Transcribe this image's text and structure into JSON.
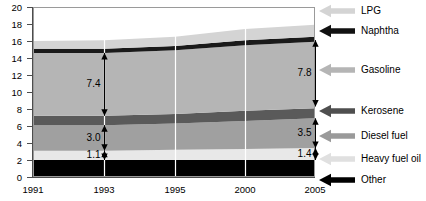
{
  "chart_data": {
    "type": "area",
    "stacked": true,
    "title": "",
    "subtitle": "",
    "xlabel": "",
    "ylabel": "",
    "x": [
      1991,
      1993,
      1995,
      2000,
      2005
    ],
    "xtick_labels": [
      "1991",
      "1993",
      "1995",
      "2000",
      "2005"
    ],
    "xtick_positions_px": [
      33,
      104,
      175,
      245,
      315
    ],
    "ylim": [
      0,
      20
    ],
    "ytick_labels": [
      "0",
      "2",
      "4",
      "6",
      "8",
      "10",
      "12",
      "14",
      "16",
      "18",
      "20"
    ],
    "ytick_values": [
      0,
      2,
      4,
      6,
      8,
      10,
      12,
      14,
      16,
      18,
      20
    ],
    "grid": "vertical-only",
    "gridline_color": "#ffffff",
    "gridline_x": [
      1993,
      1995,
      2000
    ],
    "legend_position": "right",
    "series": [
      {
        "name": "Other",
        "color": "#000000",
        "values": [
          2.0,
          2.0,
          2.0,
          2.0,
          2.0
        ]
      },
      {
        "name": "Heavy fuel oil",
        "color": "#e8e8e8",
        "values": [
          1.1,
          1.1,
          1.2,
          1.3,
          1.4
        ]
      },
      {
        "name": "Diesel fuel",
        "color": "#a0a0a0",
        "values": [
          3.0,
          3.0,
          3.1,
          3.3,
          3.5
        ]
      },
      {
        "name": "Kerosene",
        "color": "#5a5a5a",
        "values": [
          1.1,
          1.1,
          1.1,
          1.2,
          1.2
        ]
      },
      {
        "name": "Gasoline",
        "color": "#b5b5b5",
        "values": [
          7.4,
          7.4,
          7.5,
          7.7,
          7.8
        ]
      },
      {
        "name": "Naphtha",
        "color": "#1a1a1a",
        "values": [
          0.5,
          0.5,
          0.5,
          0.6,
          0.6
        ]
      },
      {
        "name": "LPG",
        "color": "#d4d4d4",
        "values": [
          0.9,
          1.0,
          1.1,
          1.3,
          1.4
        ]
      }
    ],
    "annotations": [
      {
        "id": "gasoline-1993",
        "label": "7.4",
        "x": 1993,
        "y_from": 7.2,
        "y_to": 14.6
      },
      {
        "id": "gasoline-2005",
        "label": "7.8",
        "x": 2005,
        "y_from": 8.3,
        "y_to": 16.1
      },
      {
        "id": "diesel-1993",
        "label": "3.0",
        "x": 1993,
        "y_from": 3.1,
        "y_to": 6.1
      },
      {
        "id": "diesel-2005",
        "label": "3.5",
        "x": 2005,
        "y_from": 3.4,
        "y_to": 6.9
      },
      {
        "id": "heavy-1993",
        "label": "1.1",
        "x": 1993,
        "y_from": 2.0,
        "y_to": 3.1
      },
      {
        "id": "heavy-2005",
        "label": "1.4",
        "x": 2005,
        "y_from": 2.0,
        "y_to": 3.4
      }
    ]
  },
  "axes": {
    "y_ticks": [
      {
        "label": "20",
        "top": 3
      },
      {
        "label": "18",
        "top": 20
      },
      {
        "label": "16",
        "top": 37
      },
      {
        "label": "14",
        "top": 54
      },
      {
        "label": "12",
        "top": 71
      },
      {
        "label": "10",
        "top": 88
      },
      {
        "label": "8",
        "top": 105
      },
      {
        "label": "6",
        "top": 122
      },
      {
        "label": "4",
        "top": 139
      },
      {
        "label": "2",
        "top": 156
      },
      {
        "label": "0",
        "top": 173
      }
    ],
    "x_ticks": [
      {
        "label": "1991",
        "left": 13
      },
      {
        "label": "1993",
        "left": 84
      },
      {
        "label": "1995",
        "left": 155
      },
      {
        "label": "2000",
        "left": 225
      },
      {
        "label": "2005",
        "left": 295
      }
    ]
  },
  "annotation_labels": {
    "gasoline_1993": "7.4",
    "gasoline_2005": "7.8",
    "diesel_1993": "3.0",
    "diesel_2005": "3.5",
    "heavy_1993": "1.1",
    "heavy_2005": "1.4"
  },
  "legend": {
    "items": [
      {
        "label": "LPG",
        "color": "#d4d4d4",
        "top": 4
      },
      {
        "label": "Naphtha",
        "color": "#111111",
        "top": 24
      },
      {
        "label": "Gasoline",
        "color": "#b5b5b5",
        "top": 63
      },
      {
        "label": "Kerosene",
        "color": "#4f4f4f",
        "top": 104
      },
      {
        "label": "Diesel fuel",
        "color": "#9a9a9a",
        "top": 129
      },
      {
        "label": "Heavy fuel oil",
        "color": "#e0e0e0",
        "top": 152
      },
      {
        "label": "Other",
        "color": "#000000",
        "top": 173
      }
    ]
  }
}
